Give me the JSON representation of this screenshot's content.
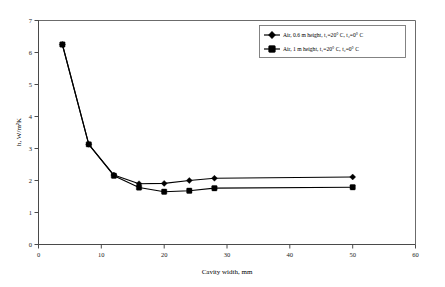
{
  "chart_data": {
    "type": "line",
    "title": "",
    "xlabel": "Cavity width, mm",
    "ylabel": "h, W/m²K",
    "xlim": [
      0,
      60
    ],
    "ylim": [
      0,
      7
    ],
    "xticks": [
      0,
      10,
      20,
      30,
      40,
      50,
      60
    ],
    "xticklabels": [
      "0",
      "10",
      "20",
      "30",
      "40",
      "50",
      "60"
    ],
    "yticks": [
      0,
      1,
      2,
      3,
      4,
      5,
      6,
      7
    ],
    "yticklabels": [
      "0",
      "1",
      "2",
      "3",
      "4",
      "5",
      "6",
      "7"
    ],
    "grid": false,
    "legend_position": "upper right",
    "marker": "filled-diamond-square",
    "series": [
      {
        "name": "Air, 0.6 m height, t₁=20° C, t₂=0° C",
        "x": [
          3.8,
          8.0,
          12.0,
          16.0,
          20.0,
          24.0,
          28.0,
          50.0
        ],
        "y": [
          6.25,
          3.13,
          2.17,
          1.9,
          1.91,
          2.0,
          2.07,
          2.11
        ]
      },
      {
        "name": "Air, 1 m height, t₁=20° C, t₂=0° C",
        "x": [
          3.8,
          8.0,
          12.0,
          16.0,
          20.0,
          24.0,
          28.0,
          50.0
        ],
        "y": [
          6.25,
          3.13,
          2.15,
          1.78,
          1.65,
          1.68,
          1.76,
          1.79
        ]
      }
    ]
  },
  "legend": {
    "entries": [
      {
        "label": "Air, 0.6 m height, t₁=20° C, t₂=0° C"
      },
      {
        "label": "Air, 1 m height, t₁=20° C, t₂=0° C"
      }
    ]
  },
  "axes": {
    "x_title": "Cavity width, mm",
    "y_title": "h, W/m²K"
  },
  "colors": {
    "series": "#000000",
    "axis": "#4a4a4a",
    "frame": "#6b6b6b",
    "background": "#ffffff"
  }
}
